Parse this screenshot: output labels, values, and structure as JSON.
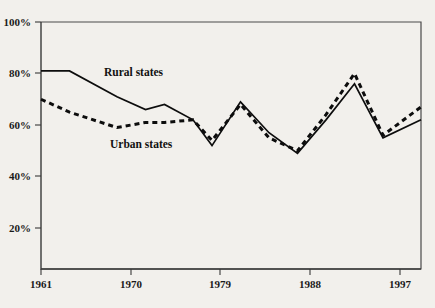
{
  "chart_data": {
    "type": "line",
    "title": "",
    "subtitle": "",
    "xlabel": "",
    "ylabel": "",
    "xlim": [
      1961,
      2001
    ],
    "ylim": [
      0,
      100
    ],
    "xtick_labels": [
      "1961",
      "1970",
      "1979",
      "1988",
      "1997"
    ],
    "xtick_values": [
      1961,
      1970,
      1979,
      1988,
      1997
    ],
    "ytick_labels": [
      "20%",
      "40%",
      "60%",
      "80%",
      "100%"
    ],
    "ytick_values": [
      20,
      40,
      60,
      80,
      100
    ],
    "grid": false,
    "legend_position": "inline-annotation",
    "annotations": [
      {
        "text": "Rural states",
        "x": 1975,
        "y": 76
      },
      {
        "text": "Urban states",
        "x": 1976,
        "y": 55
      }
    ],
    "series": [
      {
        "name": "Rural states",
        "style": "solid",
        "color": "#0d0d0d",
        "x": [
          1961,
          1964,
          1969,
          1972,
          1974,
          1977,
          1979,
          1982,
          1985,
          1988,
          1991,
          1994,
          1997,
          2001
        ],
        "values": [
          81,
          81,
          71,
          66,
          68,
          62,
          52,
          69,
          57,
          49,
          62,
          76,
          55,
          62
        ]
      },
      {
        "name": "Urban states",
        "style": "dashed",
        "color": "#0d0d0d",
        "x": [
          1961,
          1964,
          1969,
          1972,
          1974,
          1977,
          1979,
          1982,
          1985,
          1988,
          1991,
          1994,
          1997,
          2001
        ],
        "values": [
          70,
          65,
          59,
          61,
          61,
          62,
          54,
          68,
          55,
          50,
          64,
          80,
          56,
          67
        ]
      }
    ]
  },
  "axes": {
    "y_label_texts": [
      "100%",
      "80%",
      "60%",
      "40%",
      "20%"
    ],
    "x_label_texts": [
      "1961",
      "1970",
      "1979",
      "1988",
      "1997"
    ]
  },
  "labels": {
    "rural": "Rural states",
    "urban": "Urban states"
  }
}
